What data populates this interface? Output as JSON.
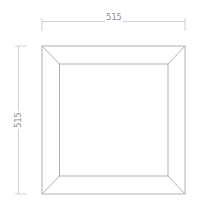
{
  "diagram": {
    "dimensions": {
      "width_label": "515",
      "height_label": "515"
    },
    "colors": {
      "line": "#a8a8a8",
      "dim_line": "#c8c8c8",
      "text": "#8a8a8a"
    }
  }
}
